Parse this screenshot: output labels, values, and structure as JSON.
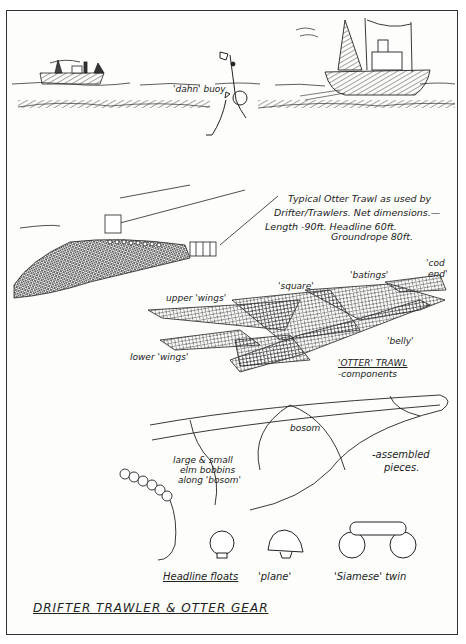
{
  "title": "DRIFTER TRAWLER & OTTER GEAR",
  "scene": {
    "buoy_label": "'dahn' buoy"
  },
  "caption": {
    "line1": "Typical  Otter Trawl as used by",
    "line2": "Drifter/Trawlers.  Net dimensions.—",
    "line3": "Length -90ft.  Headline 60ft.",
    "line4": "Groundrope  80ft."
  },
  "components": {
    "labels": {
      "upper_wings": "upper 'wings'",
      "lower_wings": "lower 'wings'",
      "square": "'square'",
      "batings": "'batings'",
      "cod_end_1": "'cod",
      "cod_end_2": "end'",
      "belly": "'belly'"
    },
    "heading": "'OTTER' TRAWL",
    "subheading": "-components"
  },
  "assembled": {
    "bosom": "bosom",
    "label_1": "-assembled",
    "label_2": "pieces."
  },
  "bobbins": {
    "line1": "large & small",
    "line2": "elm bobbins",
    "line3": "along 'bosom'"
  },
  "floats": {
    "heading": "Headline floats",
    "plane": "'plane'",
    "siamese": "'Siamese' twin"
  }
}
